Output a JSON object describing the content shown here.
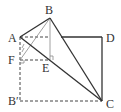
{
  "diagram": {
    "points": {
      "A": {
        "label": "A",
        "x": 20,
        "y": 37
      },
      "B": {
        "label": "B",
        "x": 50,
        "y": 18
      },
      "D": {
        "label": "D",
        "x": 102,
        "y": 37
      },
      "C": {
        "label": "C",
        "x": 102,
        "y": 101
      },
      "B_prime": {
        "label": "B′",
        "x": 20,
        "y": 101
      },
      "F": {
        "label": "F",
        "x": 20,
        "y": 60
      },
      "E": {
        "label": "E",
        "x": 50,
        "y": 60
      }
    },
    "colors": {
      "line": "#333333",
      "thin": "#777777"
    }
  }
}
